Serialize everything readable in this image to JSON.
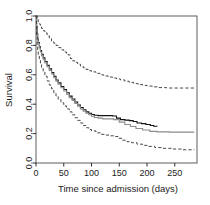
{
  "chart_data": {
    "type": "line",
    "title": "",
    "xlabel": "Time since admission (days)",
    "ylabel": "Survival",
    "xlim": [
      0,
      290
    ],
    "ylim": [
      0.0,
      1.0
    ],
    "grid": false,
    "legend": "none",
    "xticks": [
      0,
      50,
      100,
      150,
      200,
      250
    ],
    "xtick_labels": [
      "0",
      "50",
      "100",
      "150",
      "200",
      "250"
    ],
    "yticks": [
      0.0,
      0.2,
      0.4,
      0.6,
      0.8,
      1.0
    ],
    "ytick_labels": [
      "0.0",
      "0.2",
      "0.4",
      "0.6",
      "0.8",
      "1.0"
    ],
    "series": [
      {
        "name": "upper-confidence-band",
        "style": "dashed",
        "color": "#333333",
        "points": [
          [
            0,
            1.0
          ],
          [
            2,
            0.98
          ],
          [
            4,
            0.96
          ],
          [
            6,
            0.945
          ],
          [
            8,
            0.93
          ],
          [
            10,
            0.915
          ],
          [
            13,
            0.9
          ],
          [
            16,
            0.885
          ],
          [
            20,
            0.865
          ],
          [
            24,
            0.845
          ],
          [
            28,
            0.83
          ],
          [
            32,
            0.815
          ],
          [
            36,
            0.8
          ],
          [
            40,
            0.785
          ],
          [
            45,
            0.77
          ],
          [
            50,
            0.755
          ],
          [
            55,
            0.745
          ],
          [
            58,
            0.735
          ],
          [
            62,
            0.71
          ],
          [
            66,
            0.695
          ],
          [
            70,
            0.685
          ],
          [
            75,
            0.672
          ],
          [
            80,
            0.66
          ],
          [
            85,
            0.648
          ],
          [
            90,
            0.637
          ],
          [
            95,
            0.628
          ],
          [
            100,
            0.62
          ],
          [
            108,
            0.61
          ],
          [
            115,
            0.6
          ],
          [
            122,
            0.592
          ],
          [
            130,
            0.585
          ],
          [
            138,
            0.578
          ],
          [
            145,
            0.572
          ],
          [
            152,
            0.565
          ],
          [
            160,
            0.556
          ],
          [
            168,
            0.548
          ],
          [
            176,
            0.54
          ],
          [
            184,
            0.534
          ],
          [
            192,
            0.528
          ],
          [
            200,
            0.523
          ],
          [
            210,
            0.518
          ],
          [
            220,
            0.513
          ],
          [
            235,
            0.51
          ],
          [
            250,
            0.51
          ],
          [
            265,
            0.51
          ],
          [
            285,
            0.51
          ]
        ]
      },
      {
        "name": "survival-estimate-black",
        "style": "solid",
        "color": "#111111",
        "points": [
          [
            0,
            1.0
          ],
          [
            1,
            0.93
          ],
          [
            2,
            0.88
          ],
          [
            3,
            0.845
          ],
          [
            4,
            0.82
          ],
          [
            6,
            0.79
          ],
          [
            8,
            0.765
          ],
          [
            10,
            0.74
          ],
          [
            13,
            0.715
          ],
          [
            16,
            0.69
          ],
          [
            20,
            0.665
          ],
          [
            24,
            0.64
          ],
          [
            28,
            0.615
          ],
          [
            32,
            0.59
          ],
          [
            36,
            0.565
          ],
          [
            40,
            0.545
          ],
          [
            45,
            0.52
          ],
          [
            50,
            0.5
          ],
          [
            55,
            0.478
          ],
          [
            60,
            0.455
          ],
          [
            65,
            0.435
          ],
          [
            70,
            0.415
          ],
          [
            75,
            0.395
          ],
          [
            80,
            0.378
          ],
          [
            85,
            0.362
          ],
          [
            90,
            0.348
          ],
          [
            95,
            0.338
          ],
          [
            100,
            0.33
          ],
          [
            105,
            0.325
          ],
          [
            112,
            0.322
          ],
          [
            120,
            0.322
          ],
          [
            130,
            0.322
          ],
          [
            138,
            0.32
          ],
          [
            145,
            0.305
          ],
          [
            152,
            0.295
          ],
          [
            160,
            0.292
          ],
          [
            168,
            0.288
          ],
          [
            175,
            0.282
          ],
          [
            182,
            0.272
          ],
          [
            190,
            0.268
          ],
          [
            198,
            0.262
          ],
          [
            206,
            0.255
          ],
          [
            212,
            0.25
          ],
          [
            218,
            0.248
          ]
        ]
      },
      {
        "name": "survival-estimate-gray",
        "style": "solid",
        "color": "#8c8c8c",
        "points": [
          [
            0,
            1.0
          ],
          [
            1,
            0.92
          ],
          [
            2,
            0.87
          ],
          [
            3,
            0.838
          ],
          [
            4,
            0.812
          ],
          [
            6,
            0.782
          ],
          [
            8,
            0.755
          ],
          [
            10,
            0.73
          ],
          [
            13,
            0.705
          ],
          [
            16,
            0.68
          ],
          [
            20,
            0.655
          ],
          [
            24,
            0.63
          ],
          [
            28,
            0.605
          ],
          [
            32,
            0.58
          ],
          [
            36,
            0.556
          ],
          [
            40,
            0.536
          ],
          [
            45,
            0.512
          ],
          [
            50,
            0.49
          ],
          [
            55,
            0.468
          ],
          [
            60,
            0.445
          ],
          [
            65,
            0.425
          ],
          [
            70,
            0.405
          ],
          [
            75,
            0.386
          ],
          [
            80,
            0.368
          ],
          [
            85,
            0.352
          ],
          [
            90,
            0.338
          ],
          [
            95,
            0.328
          ],
          [
            100,
            0.318
          ],
          [
            105,
            0.31
          ],
          [
            112,
            0.305
          ],
          [
            120,
            0.3
          ],
          [
            130,
            0.3
          ],
          [
            140,
            0.295
          ],
          [
            150,
            0.278
          ],
          [
            160,
            0.262
          ],
          [
            170,
            0.248
          ],
          [
            180,
            0.235
          ],
          [
            192,
            0.225
          ],
          [
            205,
            0.215
          ],
          [
            218,
            0.212
          ],
          [
            240,
            0.21
          ],
          [
            265,
            0.21
          ],
          [
            285,
            0.21
          ]
        ]
      },
      {
        "name": "lower-confidence-band",
        "style": "dashed",
        "color": "#333333",
        "points": [
          [
            0,
            1.0
          ],
          [
            1,
            0.87
          ],
          [
            2,
            0.8
          ],
          [
            3,
            0.76
          ],
          [
            4,
            0.735
          ],
          [
            6,
            0.7
          ],
          [
            8,
            0.675
          ],
          [
            10,
            0.65
          ],
          [
            13,
            0.62
          ],
          [
            16,
            0.59
          ],
          [
            20,
            0.558
          ],
          [
            24,
            0.53
          ],
          [
            28,
            0.505
          ],
          [
            32,
            0.478
          ],
          [
            36,
            0.455
          ],
          [
            40,
            0.432
          ],
          [
            45,
            0.41
          ],
          [
            50,
            0.388
          ],
          [
            55,
            0.368
          ],
          [
            60,
            0.348
          ],
          [
            65,
            0.328
          ],
          [
            70,
            0.308
          ],
          [
            75,
            0.29
          ],
          [
            80,
            0.272
          ],
          [
            85,
            0.255
          ],
          [
            90,
            0.24
          ],
          [
            95,
            0.228
          ],
          [
            100,
            0.218
          ],
          [
            108,
            0.205
          ],
          [
            116,
            0.195
          ],
          [
            124,
            0.19
          ],
          [
            132,
            0.185
          ],
          [
            140,
            0.18
          ],
          [
            148,
            0.168
          ],
          [
            156,
            0.155
          ],
          [
            164,
            0.145
          ],
          [
            172,
            0.138
          ],
          [
            182,
            0.128
          ],
          [
            192,
            0.12
          ],
          [
            202,
            0.113
          ],
          [
            214,
            0.105
          ],
          [
            228,
            0.1
          ],
          [
            244,
            0.095
          ],
          [
            262,
            0.09
          ],
          [
            285,
            0.088
          ]
        ]
      }
    ]
  },
  "axes": {
    "tick_color": "#1a1a1a",
    "frame_color": "#4d4d4d"
  }
}
